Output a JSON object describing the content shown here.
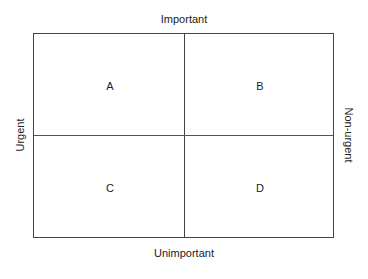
{
  "axes": {
    "top": "Important",
    "bottom": "Unimportant",
    "left": "Urgent",
    "right": "Non-urgent"
  },
  "quadrants": [
    {
      "id": "A",
      "label": "A",
      "position": "top-left"
    },
    {
      "id": "B",
      "label": "B",
      "position": "top-right"
    },
    {
      "id": "C",
      "label": "C",
      "position": "bottom-left"
    },
    {
      "id": "D",
      "label": "D",
      "position": "bottom-right"
    }
  ],
  "colors": {
    "line": "#444444",
    "text": "#222222",
    "background": "#ffffff"
  }
}
